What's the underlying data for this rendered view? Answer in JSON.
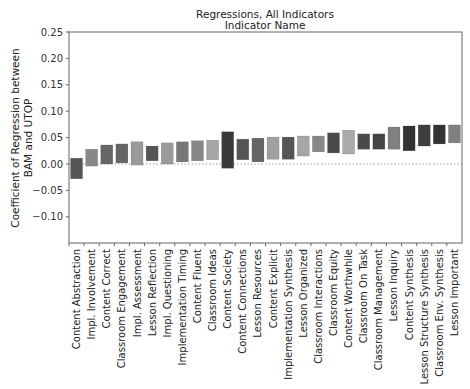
{
  "chart_data": {
    "type": "bar",
    "subtype": "floating-range-bar",
    "title": "Regressions, All Indicators",
    "subtitle": "Indicator Name",
    "xlabel": "",
    "ylabel_lines": [
      "Coefficient of Regression between",
      "BAM and UTOP"
    ],
    "ylim": [
      -0.15,
      0.25
    ],
    "yticks": [
      0.25,
      0.2,
      0.15,
      0.1,
      0.05,
      0.0,
      -0.05,
      -0.1
    ],
    "ytick_labels": [
      "0.25",
      "0.20",
      "0.15",
      "0.10",
      "0.05",
      "0.00",
      "−0.05",
      "−0.10"
    ],
    "zero_line": "dotted",
    "grid": false,
    "legend": null,
    "categories": [
      "Content Abstraction",
      "Impl. Involvement",
      "Content Correct",
      "Classroom Engagement",
      "Impl. Assessment",
      "Lesson Reflection",
      "Impl. Questioning",
      "Implementation Timing",
      "Content Fluent",
      "Classroom Ideas",
      "Content Society",
      "Content Connections",
      "Lesson Resources",
      "Content Explicit",
      "Implementation Synthesis",
      "Lesson Organized",
      "Classroom Interactions",
      "Classroom Equity",
      "Content Worthwhile",
      "Classroom On Task",
      "Classroom Management",
      "Lesson Inquiry",
      "Content Synthesis",
      "Lesson Structure Synthesis",
      "Classroom Env. Synthesis",
      "Lesson Important"
    ],
    "series": [
      {
        "name": "upper",
        "values": [
          0.011,
          0.028,
          0.036,
          0.038,
          0.042,
          0.034,
          0.04,
          0.042,
          0.044,
          0.045,
          0.061,
          0.047,
          0.049,
          0.051,
          0.051,
          0.053,
          0.053,
          0.059,
          0.064,
          0.057,
          0.057,
          0.07,
          0.072,
          0.074,
          0.074,
          0.074
        ]
      },
      {
        "name": "lower",
        "values": [
          -0.028,
          -0.004,
          0.0,
          0.002,
          -0.002,
          0.006,
          0.0,
          0.004,
          0.006,
          0.008,
          -0.008,
          0.008,
          0.004,
          0.009,
          0.009,
          0.015,
          0.023,
          0.021,
          0.019,
          0.028,
          0.028,
          0.028,
          0.025,
          0.034,
          0.038,
          0.04
        ]
      }
    ],
    "bar_colors": [
      "#555555",
      "#888888",
      "#666666",
      "#666666",
      "#9a9a9a",
      "#555555",
      "#9a9a9a",
      "#777777",
      "#888888",
      "#a6a6a6",
      "#3a3a3a",
      "#555555",
      "#666666",
      "#a0a0a0",
      "#555555",
      "#a6a6a6",
      "#888888",
      "#4a4a4a",
      "#aaaaaa",
      "#4a4a4a",
      "#444444",
      "#808080",
      "#333333",
      "#3e3e3e",
      "#333333",
      "#808080"
    ]
  }
}
